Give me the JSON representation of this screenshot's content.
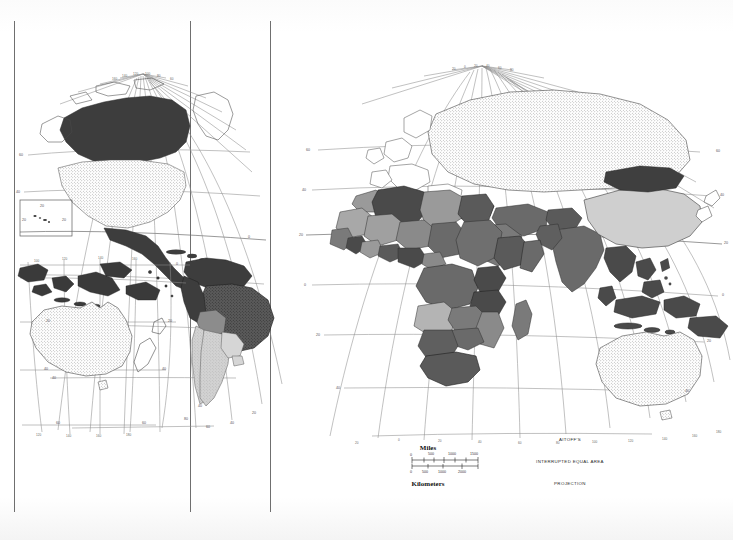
{
  "document": {
    "type": "world-map-plate",
    "projection_note_lines": [
      "AITOFF'S",
      "INTERRUPTED  EQUAL  AREA",
      "PROJECTION"
    ],
    "background_color": "#ffffff",
    "panel_count": 4
  },
  "scale_bar": {
    "top_label": "Miles",
    "bottom_label": "Kilometers",
    "miles_ticks": [
      "0",
      "500",
      "1000",
      "1500"
    ],
    "kilometers_ticks": [
      "0",
      "500",
      "1000",
      "2000"
    ]
  },
  "graticule": {
    "latitude_labels_west": [
      "60",
      "40",
      "20",
      "0",
      "20",
      "40",
      "60"
    ],
    "latitude_labels_east": [
      "60",
      "40",
      "20",
      "0",
      "20",
      "40",
      "60"
    ],
    "longitude_labels_bottom_east": [
      "20",
      "0",
      "20",
      "40",
      "60",
      "80",
      "100",
      "120",
      "140",
      "160",
      "180"
    ],
    "longitude_labels_bottom_australia": [
      "120",
      "140",
      "160",
      "180"
    ],
    "longitude_labels_bottom_samerica": [
      "80",
      "60",
      "40",
      "20"
    ],
    "longitude_labels_top_namerica": [
      "160",
      "140",
      "120",
      "100",
      "80",
      "60"
    ],
    "longitude_labels_top_eurasia": [
      "20",
      "0",
      "20",
      "40",
      "60",
      "80",
      "100",
      "120",
      "140",
      "160"
    ],
    "interval_degrees": 20
  },
  "legend_shades": {
    "dark": "#4a4a4a",
    "medium": "#8c8c8c",
    "light": "#c9c9c9",
    "stipple": "#e6e6e6",
    "blank": "#ffffff"
  },
  "inset": {
    "label_left": "20",
    "label_right": "20",
    "label_top": "20"
  },
  "regions": {
    "north_america": [
      "Canada",
      "United States",
      "Mexico",
      "Greenland",
      "Alaska"
    ],
    "south_america": [
      "Brazil",
      "Colombia",
      "Venezuela",
      "Peru",
      "Bolivia",
      "Argentina",
      "Chile",
      "Paraguay",
      "Uruguay",
      "Guyana"
    ],
    "africa": [
      "Algeria",
      "Libya",
      "Egypt",
      "Sudan",
      "Chad",
      "Niger",
      "Mali",
      "Nigeria",
      "Ethiopia",
      "Kenya",
      "Tanzania",
      "Angola",
      "Zaire",
      "Zambia",
      "South Africa",
      "Madagascar"
    ],
    "eurasia": [
      "USSR",
      "China",
      "Mongolia",
      "India",
      "Iran",
      "Saudi Arabia",
      "Turkey",
      "Europe"
    ],
    "oceania": [
      "Australia",
      "New Zealand",
      "Indonesia",
      "Papua New Guinea",
      "Philippines"
    ]
  }
}
